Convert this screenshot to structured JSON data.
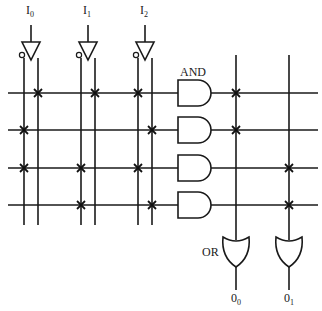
{
  "colors": {
    "line": "#1a1a1a",
    "background": "#ffffff"
  },
  "inputs": [
    {
      "label": "I",
      "sub": "0",
      "x": 31
    },
    {
      "label": "I",
      "sub": "1",
      "x": 88
    },
    {
      "label": "I",
      "sub": "2",
      "x": 145
    }
  ],
  "input_columns": [
    {
      "name": "I0-complement",
      "x": 24
    },
    {
      "name": "I0-true",
      "x": 38
    },
    {
      "name": "I1-complement",
      "x": 81
    },
    {
      "name": "I1-true",
      "x": 95
    },
    {
      "name": "I2-complement",
      "x": 138
    },
    {
      "name": "I2-true",
      "x": 152
    }
  ],
  "and_array": {
    "label": "AND",
    "rows_y": [
      93,
      130,
      168,
      205
    ],
    "connections": [
      [
        38,
        95,
        138
      ],
      [
        24,
        152
      ],
      [
        24,
        81,
        138
      ],
      [
        81,
        152
      ]
    ]
  },
  "or_array": {
    "label": "OR",
    "columns_x": [
      236,
      289
    ],
    "connections": [
      {
        "row": 0,
        "col": 0
      },
      {
        "row": 1,
        "col": 0
      },
      {
        "row": 2,
        "col": 1
      },
      {
        "row": 3,
        "col": 1
      }
    ]
  },
  "outputs": [
    {
      "label": "0",
      "sub": "0"
    },
    {
      "label": "0",
      "sub": "1"
    }
  ]
}
